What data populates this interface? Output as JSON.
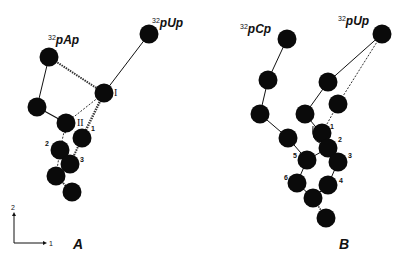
{
  "panels": {
    "A": {
      "label": "A",
      "labels": {
        "pAp": {
          "sup": "32",
          "text": "pAp"
        },
        "pUp": {
          "sup": "32",
          "text": "pUp"
        },
        "site_I": "I",
        "site_II": "II",
        "n1": "1",
        "n2": "2",
        "n3": "3"
      }
    },
    "B": {
      "label": "B",
      "labels": {
        "pCp": {
          "sup": "32",
          "text": "pCp"
        },
        "pUp": {
          "sup": "32",
          "text": "pUp"
        },
        "n1": "1",
        "n2": "2",
        "n3": "3",
        "n4": "4",
        "n5": "5",
        "n6": "6"
      }
    }
  },
  "axes": {
    "x_label": "1",
    "y_label": "2"
  }
}
